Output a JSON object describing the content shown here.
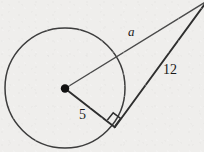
{
  "figure": {
    "background_color": "#efeeec",
    "stroke_color": "#3c3c3c",
    "label_color": "#1a1a1a",
    "circle": {
      "center_x": 65,
      "center_y": 88,
      "radius_px": 60,
      "center_dot_radius_px": 4.2
    },
    "points": {
      "center_label": "O",
      "tangent_point_x": 115,
      "tangent_point_y": 127,
      "apex_x": 206,
      "apex_y": 2
    },
    "segments": [
      {
        "name": "hypotenuse-a",
        "label": "a",
        "style": "italic",
        "from": "center",
        "to": "apex"
      },
      {
        "name": "tangent-12",
        "label": "12",
        "style": "upright",
        "from": "tangent-point",
        "to": "apex"
      },
      {
        "name": "radius-5",
        "label": "5",
        "style": "upright",
        "from": "center",
        "to": "tangent-point"
      }
    ],
    "labels": {
      "hypotenuse": "a",
      "tangent_length": "12",
      "radius_length": "5"
    },
    "right_angle_marker": {
      "present": true,
      "at": "tangent-point",
      "size_px": 9
    }
  }
}
